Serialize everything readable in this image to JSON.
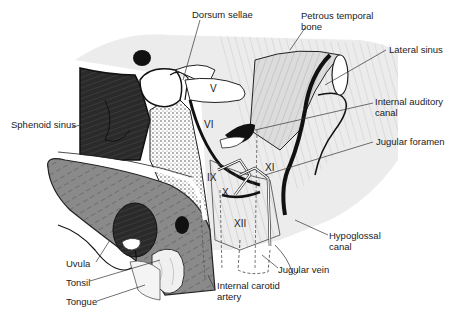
{
  "figure": {
    "type": "anatomical-illustration",
    "colors": {
      "background": "#ffffff",
      "sinus_dark": "#2a2a2a",
      "soft_palate_gray": "#8a8a8a",
      "tissue_light": "#e8e8e8",
      "bone_gray": "#d4d4d4",
      "ink": "#111111"
    }
  },
  "labels": {
    "dorsum_sellae": "Dorsum sellae",
    "petrous_temporal_bone_1": "Petrous temporal",
    "petrous_temporal_bone_2": "bone",
    "lateral_sinus": "Lateral sinus",
    "sphenoid_sinus": "Sphenoid sinus",
    "internal_auditory_canal_1": "Internal auditory",
    "internal_auditory_canal_2": "canal",
    "jugular_foramen": "Jugular foramen",
    "hypoglossal_canal_1": "Hypoglossal",
    "hypoglossal_canal_2": "canal",
    "jugular_vein": "Jugular vein",
    "uvula": "Uvula",
    "tonsil": "Tonsil",
    "tongue": "Tongue",
    "internal_carotid_artery_1": "Internal carotid",
    "internal_carotid_artery_2": "artery"
  },
  "nerve_numerals": {
    "v": "V",
    "vi": "VI",
    "ix": "IX",
    "x": "X",
    "xi": "XI",
    "xii": "XII"
  }
}
